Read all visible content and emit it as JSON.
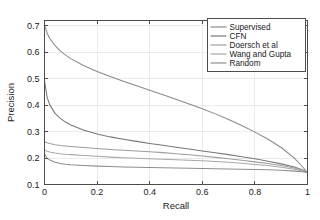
{
  "chart_data": {
    "type": "line",
    "title": "",
    "xlabel": "Recall",
    "ylabel": "Precision",
    "xlim": [
      0,
      1
    ],
    "ylim": [
      0.1,
      0.72
    ],
    "xticks": [
      "0",
      "0.2",
      "0.4",
      "0.6",
      "0.8",
      "1"
    ],
    "xtick_values": [
      0,
      0.2,
      0.4,
      0.6,
      0.8,
      1
    ],
    "yticks": [
      "0.1",
      "0.2",
      "0.3",
      "0.4",
      "0.5",
      "0.6",
      "0.7"
    ],
    "ytick_values": [
      0.1,
      0.2,
      0.3,
      0.4,
      0.5,
      0.6,
      0.7
    ],
    "grid": true,
    "legend_position": "top-right",
    "x": [
      0,
      0.01,
      0.02,
      0.04,
      0.06,
      0.08,
      0.1,
      0.15,
      0.2,
      0.25,
      0.3,
      0.35,
      0.4,
      0.45,
      0.5,
      0.55,
      0.6,
      0.65,
      0.7,
      0.75,
      0.8,
      0.85,
      0.9,
      0.95,
      0.98,
      1
    ],
    "series": [
      {
        "name": "Supervised",
        "color": "#8a8a8a",
        "values": [
          0.703,
          0.672,
          0.652,
          0.625,
          0.605,
          0.589,
          0.576,
          0.549,
          0.527,
          0.508,
          0.49,
          0.473,
          0.456,
          0.439,
          0.422,
          0.404,
          0.386,
          0.367,
          0.346,
          0.323,
          0.298,
          0.271,
          0.24,
          0.2,
          0.168,
          0.145
        ]
      },
      {
        "name": "CFN",
        "color": "#787878",
        "values": [
          0.492,
          0.43,
          0.401,
          0.369,
          0.35,
          0.336,
          0.325,
          0.305,
          0.291,
          0.28,
          0.271,
          0.263,
          0.255,
          0.248,
          0.241,
          0.234,
          0.227,
          0.22,
          0.213,
          0.205,
          0.197,
          0.188,
          0.178,
          0.166,
          0.156,
          0.145
        ]
      },
      {
        "name": "Doersch et al",
        "color": "#9e9e9e",
        "values": [
          0.262,
          0.258,
          0.255,
          0.2505,
          0.2475,
          0.2455,
          0.2435,
          0.2395,
          0.236,
          0.2325,
          0.2295,
          0.2265,
          0.2235,
          0.2205,
          0.2165,
          0.2125,
          0.2075,
          0.2025,
          0.1975,
          0.1915,
          0.1855,
          0.179,
          0.1715,
          0.1625,
          0.155,
          0.145
        ]
      },
      {
        "name": "Wang and Gupta",
        "color": "#a8a8a8",
        "values": [
          0.231,
          0.2255,
          0.2225,
          0.219,
          0.2165,
          0.2145,
          0.213,
          0.2095,
          0.2065,
          0.2035,
          0.2015,
          0.1995,
          0.1975,
          0.1955,
          0.1935,
          0.1915,
          0.1895,
          0.187,
          0.184,
          0.1805,
          0.176,
          0.1715,
          0.1655,
          0.158,
          0.1515,
          0.145
        ]
      },
      {
        "name": "Random",
        "color": "#8f8f8f",
        "values": [
          0.214,
          0.2,
          0.1925,
          0.184,
          0.1795,
          0.1765,
          0.1745,
          0.1715,
          0.1695,
          0.168,
          0.1665,
          0.1655,
          0.1645,
          0.1635,
          0.1625,
          0.1615,
          0.1605,
          0.1595,
          0.1585,
          0.1575,
          0.1565,
          0.1555,
          0.1535,
          0.1505,
          0.148,
          0.145
        ]
      }
    ]
  }
}
